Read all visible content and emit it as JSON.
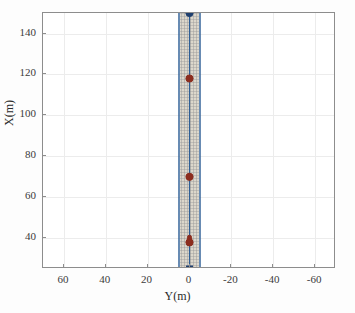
{
  "chart_data": {
    "type": "line",
    "title": "",
    "xlabel": "Y(m)",
    "ylabel": "X(m)",
    "xlim": [
      70,
      -70
    ],
    "ylim": [
      25,
      150
    ],
    "x_ticks": [
      60,
      40,
      20,
      0,
      -20,
      -40,
      -60
    ],
    "x_tick_labels": [
      "60",
      "40",
      "20",
      "0",
      "-20",
      "-40",
      "-60"
    ],
    "y_ticks": [
      40,
      60,
      80,
      100,
      120,
      140
    ],
    "y_tick_labels": [
      "40",
      "60",
      "80",
      "100",
      "120",
      "140"
    ],
    "x_axis_reversed": true,
    "grid": true,
    "legend": "none",
    "annotations": [],
    "series": [
      {
        "name": "road-corridor",
        "type": "band",
        "color": "#2f5f96",
        "fill_color": "#cfc8b8",
        "y_left_edge": 5.5,
        "y_right_edge": -5.5,
        "x_from": 25,
        "x_to": 150,
        "description": "shaded corridor band with mesh grid between lane boundaries"
      },
      {
        "name": "reference-path",
        "type": "line",
        "color": "#a02020",
        "x": [
          25,
          150
        ],
        "y": [
          0,
          0
        ],
        "description": "red centerline of corridor"
      },
      {
        "name": "vehicle-track",
        "type": "line",
        "color": "#2f5f96",
        "x": [
          25,
          150
        ],
        "y": [
          0,
          0
        ],
        "description": "blue vehicle trajectory overlapping the centerline"
      },
      {
        "name": "obstacle-markers",
        "type": "scatter",
        "color": "#8c2d1e",
        "marker": "o",
        "points": [
          {
            "x": 118,
            "y": 0
          },
          {
            "x": 70,
            "y": 0
          },
          {
            "x": 38,
            "y": 0
          }
        ]
      },
      {
        "name": "vehicle-start-marker",
        "type": "scatter",
        "color": "#1f3f6e",
        "marker": "s",
        "points": [
          {
            "x": 25,
            "y": 0
          }
        ]
      },
      {
        "name": "vehicle-goal-marker",
        "type": "scatter",
        "color": "#1f3f6e",
        "marker": "o",
        "points": [
          {
            "x": 150,
            "y": 0
          }
        ]
      },
      {
        "name": "ego-vehicle-body",
        "type": "rect",
        "color": "#8c2d1e",
        "center_x": 39,
        "center_y": 0,
        "length": 5,
        "width": 2,
        "description": "dark red rounded rectangle representing the ego vehicle footprint"
      }
    ],
    "colors": {
      "axis": "#8d8d8d",
      "grid": "#ececec",
      "corridor_fill": "#cfc8b8",
      "corridor_edge": "#2f5f96",
      "centerline": "#a02020",
      "marker_red": "#8c2d1e",
      "marker_blue": "#1f3f6e",
      "background": "#ffffff",
      "text": "#2b2b2b"
    }
  }
}
